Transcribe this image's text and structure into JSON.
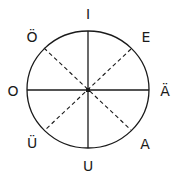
{
  "diagram": {
    "type": "vowel-circle",
    "colors": {
      "stroke": "#1a1a1a",
      "background": "#ffffff"
    },
    "ellipse": {
      "cx": 88,
      "cy": 90,
      "rx": 61,
      "ry": 58.5
    },
    "labels": {
      "top": "I",
      "top_right": "E",
      "right": "Ä",
      "bottom_right": "A",
      "bottom": "U",
      "bottom_left": "Ü",
      "left": "O",
      "top_left": "Ö"
    },
    "solid_axes": [
      "vertical I–U",
      "horizontal O–Ä"
    ],
    "dashed_axes": [
      "Ö–A",
      "E–Ü"
    ]
  }
}
